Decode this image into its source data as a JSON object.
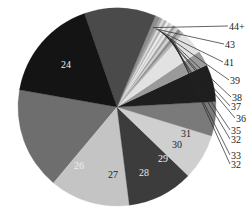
{
  "chart_data": {
    "type": "pie",
    "title": "",
    "start_angle_deg": 190,
    "direction": "counterclockwise",
    "slices": [
      {
        "label": "24",
        "value": 16.7,
        "color": "#6e6e6e",
        "show_label": true,
        "label_color": "#f0f0f0",
        "label_mode": "inside"
      },
      {
        "label": "25",
        "value": 13.1,
        "color": "#c4c4c4",
        "show_label": false,
        "label_mode": "none"
      },
      {
        "label": "26",
        "value": 10.8,
        "color": "#3c3c3c",
        "show_label": true,
        "label_color": "#f0f0f0",
        "label_mode": "inside"
      },
      {
        "label": "27",
        "value": 7.5,
        "color": "#cfcfcf",
        "show_label": true,
        "label_color": "#222222",
        "label_mode": "inside"
      },
      {
        "label": "28",
        "value": 5.6,
        "color": "#7a7a7a",
        "show_label": true,
        "label_color": "#e8e8e8",
        "label_mode": "inside"
      },
      {
        "label": "29",
        "value": 6.1,
        "color": "#1e1e1e",
        "show_label": true,
        "label_color": "#f0f0f0",
        "label_mode": "inside"
      },
      {
        "label": "30",
        "value": 2.5,
        "color": "#9a9a9a",
        "show_label": true,
        "label_color": "#222222",
        "label_mode": "inside"
      },
      {
        "label": "31",
        "value": 3.9,
        "color": "#e2e2e2",
        "show_label": true,
        "label_color": "#222222",
        "label_mode": "inside"
      },
      {
        "label": "32",
        "value": 0.5,
        "color": "#b5b5b5",
        "show_label": true,
        "label_mode": "leader"
      },
      {
        "label": "33",
        "value": 0.6,
        "color": "#8c8c8c",
        "show_label": true,
        "label_mode": "leader"
      },
      {
        "label": "32",
        "value": 0.5,
        "color": "#d0d0d0",
        "show_label": true,
        "label_mode": "leader"
      },
      {
        "label": "35",
        "value": 0.5,
        "color": "#a0a0a0",
        "show_label": true,
        "label_mode": "leader"
      },
      {
        "label": "36",
        "value": 0.4,
        "color": "#e6e6e6",
        "show_label": true,
        "label_mode": "leader"
      },
      {
        "label": "37",
        "value": 0.4,
        "color": "#c8c8c8",
        "show_label": true,
        "label_mode": "leader"
      },
      {
        "label": "38",
        "value": 0.4,
        "color": "#ededed",
        "show_label": true,
        "label_mode": "leader"
      },
      {
        "label": "39",
        "value": 0.4,
        "color": "#b0b0b0",
        "show_label": true,
        "label_mode": "leader"
      },
      {
        "label": "41",
        "value": 0.4,
        "color": "#d8d8d8",
        "show_label": true,
        "label_mode": "leader"
      },
      {
        "label": "43",
        "value": 0.4,
        "color": "#a8a8a8",
        "show_label": true,
        "label_mode": "leader"
      },
      {
        "label": "44+",
        "value": 0.8,
        "color": "#8e8e8e",
        "show_label": true,
        "label_mode": "leader"
      },
      {
        "label": "",
        "value": 11.7,
        "color": "#4a4a4a",
        "show_label": false,
        "label_mode": "none"
      },
      {
        "label": "",
        "value": 16.9,
        "color": "#141414",
        "show_label": false,
        "label_mode": "none"
      }
    ],
    "leader_label_order_top_to_bottom": [
      "44+",
      "43",
      "41",
      "39",
      "38",
      "37",
      "36",
      "35",
      "32",
      "33",
      "32"
    ],
    "legend": "none"
  }
}
